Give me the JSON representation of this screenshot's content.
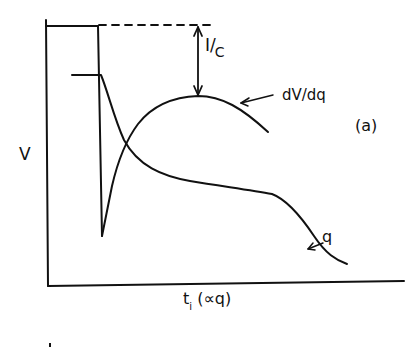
{
  "figure": {
    "panel_label": "(a)",
    "y_axis_label": "V",
    "x_axis_label_main": "t",
    "x_axis_label_sub": "i",
    "x_axis_label_suffix": " (∝q)",
    "annotation_ic_numerator": "I",
    "annotation_ic_denominator": "C",
    "annotation_ic_separator": "/",
    "curve_labels": {
      "derivative": "dV/dq",
      "charge": "q"
    }
  },
  "colors": {
    "ink": "#111111",
    "background": "#ffffff"
  },
  "curves": {
    "voltage_step": "Horizontal at top level, then vertical drop to a sharp minimum spike",
    "dV_dq": "Rises from spike minimum to a broad maximum, then decreases",
    "q": "Initial flat level, falls sharply, then gradual plateau, then falls off at end"
  }
}
